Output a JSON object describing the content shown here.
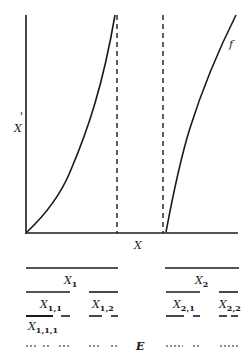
{
  "diagram": {
    "graph": {
      "y_axis_label": "X",
      "y_axis_label_prime": "'",
      "x_axis_label": "X",
      "function_label": "f"
    },
    "partition": {
      "level0": [
        {
          "label": "X",
          "sub": "1"
        },
        {
          "label": "X",
          "sub": "2"
        }
      ],
      "level1": [
        {
          "label": "X",
          "sub": "1,1"
        },
        {
          "label": "X",
          "sub": "1,2"
        },
        {
          "label": "X",
          "sub": "2,1"
        },
        {
          "label": "X",
          "sub": "2,2"
        }
      ],
      "level2": [
        {
          "label": "X",
          "sub": "1,1,1"
        }
      ],
      "limit_set_label": "E"
    },
    "colors": {
      "ink": "#1a1a1a",
      "background": "#ffffff"
    }
  }
}
